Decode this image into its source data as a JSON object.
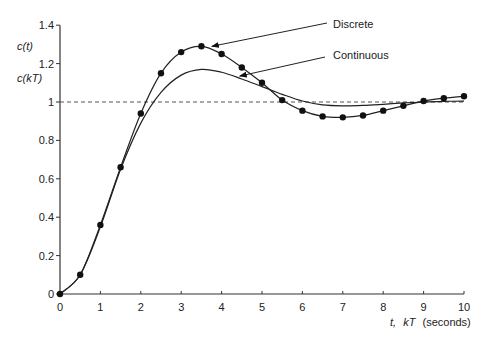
{
  "chart_data": {
    "type": "line",
    "title": "",
    "xlabel": "t, kT (seconds)",
    "xlabel_parts": {
      "t": "t,",
      "kT": "kT",
      "unit": "(seconds)"
    },
    "ylabel_lines": [
      "c(t)",
      "c(kT)"
    ],
    "xlim": [
      0,
      10
    ],
    "ylim": [
      0,
      1.4
    ],
    "x_ticks": [
      0,
      1,
      2,
      3,
      4,
      5,
      6,
      7,
      8,
      9,
      10
    ],
    "y_ticks": [
      0,
      0.2,
      0.4,
      0.6,
      0.8,
      1,
      1.2,
      1.4
    ],
    "y_tick_labels": [
      "0",
      "0.2",
      "0.4",
      "0.6",
      "0.8",
      "1",
      "1.2",
      "1.4"
    ],
    "grid": false,
    "reference_line": {
      "y": 1,
      "style": "dashed"
    },
    "series": [
      {
        "name": "Discrete",
        "markers": true,
        "x": [
          0,
          0.5,
          1,
          1.5,
          2,
          2.5,
          3,
          3.5,
          4,
          4.5,
          5,
          5.5,
          6,
          6.5,
          7,
          7.5,
          8,
          8.5,
          9,
          9.5,
          10
        ],
        "values": [
          0,
          0.1,
          0.36,
          0.66,
          0.94,
          1.15,
          1.26,
          1.29,
          1.25,
          1.18,
          1.1,
          1.01,
          0.955,
          0.925,
          0.92,
          0.93,
          0.955,
          0.98,
          1.005,
          1.02,
          1.03
        ]
      },
      {
        "name": "Continuous",
        "markers": false,
        "x": [
          0,
          0.5,
          1,
          1.5,
          2,
          2.5,
          3,
          3.5,
          4,
          4.5,
          5,
          5.5,
          6,
          6.5,
          7,
          7.5,
          8,
          8.5,
          9,
          9.5,
          10
        ],
        "values": [
          0,
          0.1,
          0.35,
          0.65,
          0.89,
          1.05,
          1.14,
          1.17,
          1.155,
          1.12,
          1.08,
          1.04,
          1.005,
          0.985,
          0.98,
          0.982,
          0.988,
          0.995,
          1.0,
          1.003,
          1.005
        ]
      }
    ],
    "annotations": [
      {
        "text": "Discrete",
        "points_to": {
          "x": 3.76,
          "y": 1.29
        }
      },
      {
        "text": "Continuous",
        "points_to": {
          "x": 4.45,
          "y": 1.135
        }
      }
    ]
  }
}
